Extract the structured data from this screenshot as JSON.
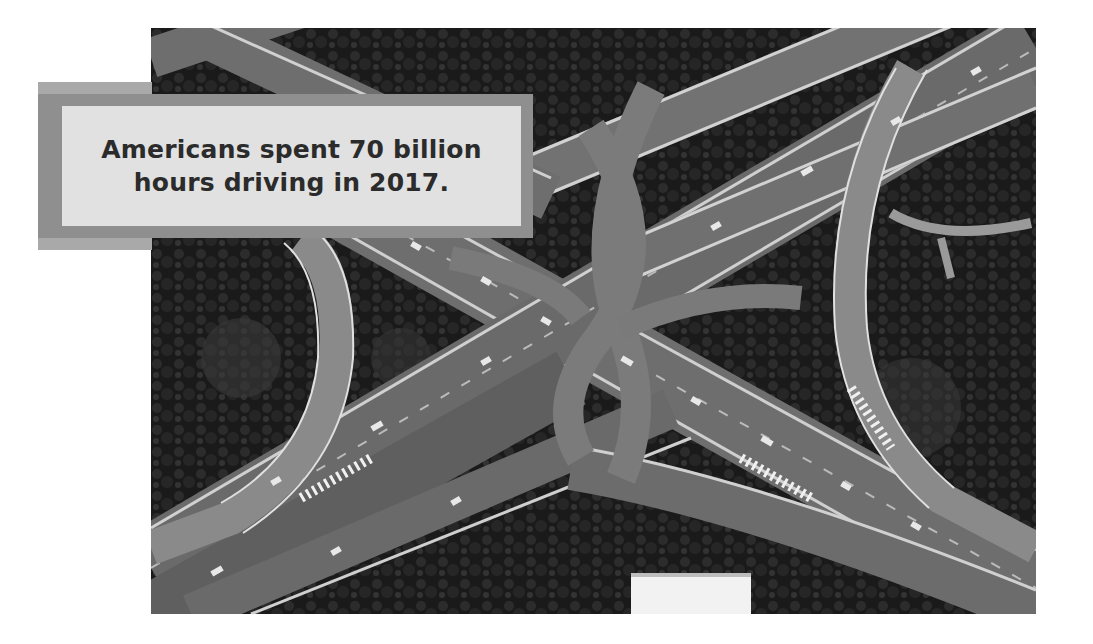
{
  "callout": {
    "line1": "Americans spent 70 billion",
    "line2": "hours driving in 2017.",
    "colors": {
      "outer_frame": "#a9a9a9",
      "mid_frame": "#8f8f8f",
      "panel": "#e1e1e1",
      "text": "#2b2b2b"
    }
  },
  "photo": {
    "subject": "aerial-highway-interchange",
    "style": "grayscale"
  }
}
